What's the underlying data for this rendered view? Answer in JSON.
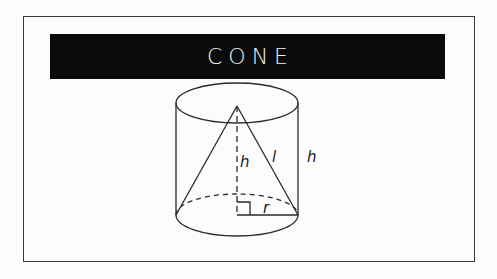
{
  "title": "CONE",
  "diagram": {
    "labels": {
      "cone_height": "h",
      "slant_height": "l",
      "cylinder_height": "h",
      "radius": "r"
    },
    "colors": {
      "title_background": "#0b0b0b",
      "title_text": "#f2f2f2",
      "stroke": "#2a2a2a",
      "frame": "#3a3a3a"
    }
  }
}
